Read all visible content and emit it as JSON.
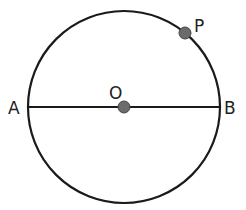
{
  "figure": {
    "type": "circle-with-diameter",
    "labels": {
      "center": "O",
      "left_end": "A",
      "right_end": "B",
      "point_on_circle": "P"
    },
    "colors": {
      "stroke": "#1a1a1a",
      "point_fill": "#6b6b6b"
    }
  }
}
